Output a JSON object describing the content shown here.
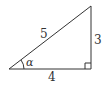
{
  "diagram": {
    "type": "right-triangle",
    "labels": {
      "hypotenuse": "5",
      "opposite": "3",
      "adjacent": "4",
      "angle": "α"
    },
    "right_angle_marker": true,
    "stroke_color": "#333333",
    "background": "#ffffff"
  }
}
